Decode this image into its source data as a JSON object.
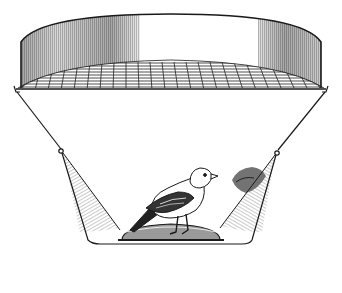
{
  "illustration": {
    "subject": "bird-in-funnel-trap",
    "description": "Black and white line drawing of a small finch perched on a mound inside a funnel-shaped cage with a cylindrical top and grid mesh",
    "colors": {
      "background": "#ffffff",
      "ink": "#1a1a1a",
      "shade": "#8a8a8a",
      "light_shade": "#cfcfcf"
    },
    "parts": {
      "top_cylinder": "cylindrical-band",
      "mesh": "grid-mesh-screen",
      "funnel": "funnel-sides",
      "bird": "finch",
      "perch": "mound-perch",
      "foliage": "foliage-patch"
    }
  }
}
